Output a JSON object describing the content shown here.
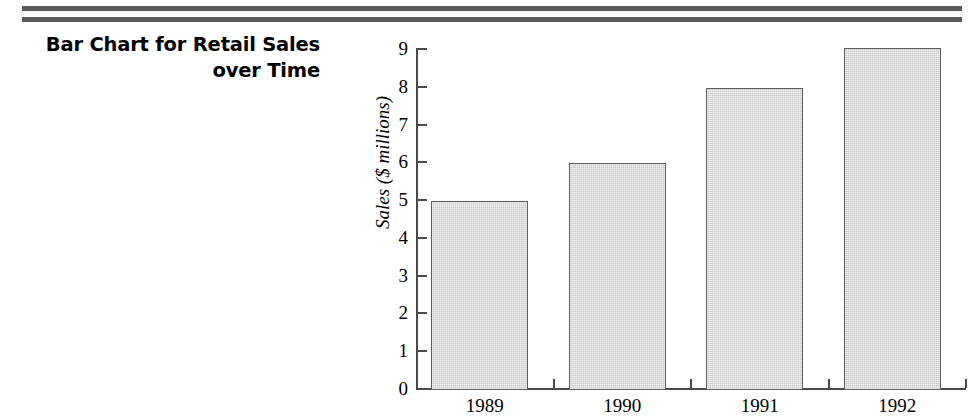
{
  "document": {
    "title_lines": "Bar Chart for Retail Sales\nover Time",
    "rule_color": "#5a5a5a"
  },
  "chart_data": {
    "type": "bar",
    "title": "Bar Chart for Retail Sales over Time",
    "xlabel": "",
    "ylabel": "Sales ($ millions)",
    "categories": [
      "1989",
      "1990",
      "1991",
      "1992"
    ],
    "values": [
      4.95,
      5.95,
      7.95,
      9.0
    ],
    "ylim": [
      0,
      9
    ],
    "yticks": [
      "9",
      "8",
      "7",
      "6",
      "5",
      "4",
      "3",
      "2",
      "1",
      "0"
    ],
    "grid": false,
    "legend": null,
    "bar_fill_color": "#d4d4d4",
    "bar_edge_color": "#5c5c5c",
    "axis_color": "#4a4a4a"
  }
}
